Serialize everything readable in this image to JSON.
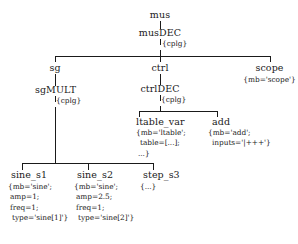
{
  "diagram": {
    "type": "tree",
    "title": "",
    "nodes": {
      "mus": {
        "name": "mus"
      },
      "musDEC": {
        "name": "musDEC",
        "attr": "{cplg}"
      },
      "sg": {
        "name": "sg"
      },
      "ctrl": {
        "name": "ctrl"
      },
      "scope": {
        "name": "scope",
        "attr": "{mb='scope'}"
      },
      "sgMULT": {
        "name": "sgMULT",
        "attr": "{cplg}"
      },
      "ctrlDEC": {
        "name": "ctrlDEC",
        "attr": "{cplg}"
      },
      "ltable_var": {
        "name": "ltable_var",
        "attr_line1": "{mb='ltable';",
        "attr_line2": "table=[...];",
        "attr_line3": "...}"
      },
      "add": {
        "name": "add",
        "attr_line1": "{mb='add';",
        "attr_line2": "inputs='|+++'}"
      },
      "sine_s1": {
        "name": "sine_s1",
        "attr_line1": "{mb='sine';",
        "attr_line2": "amp=1;",
        "attr_line3": "freq=1;",
        "attr_line4": "type='sine[1]'}"
      },
      "sine_s2": {
        "name": "sine_s2",
        "attr_line1": "{mb='sine';",
        "attr_line2": "amp=2.5;",
        "attr_line3": "freq=1;",
        "attr_line4": "type='sine[2]'}"
      },
      "step_s3": {
        "name": "step_s3",
        "attr_line1": "{...}"
      }
    },
    "colors": {
      "line": "#1a1a1a",
      "text": "#1a1a1a",
      "background": "#ffffff"
    }
  }
}
